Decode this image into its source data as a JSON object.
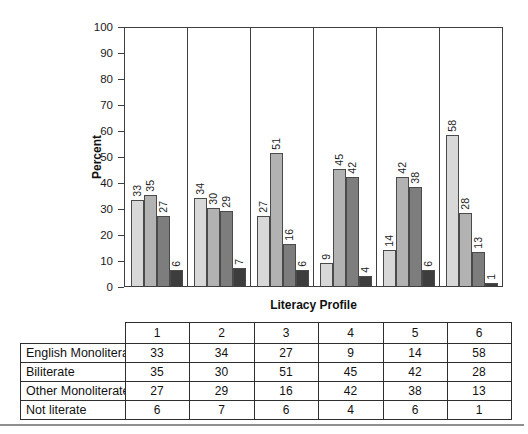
{
  "chart_data": {
    "type": "bar",
    "title": "",
    "xlabel": "Literacy Profile",
    "ylabel": "Percent",
    "ylim": [
      0,
      100
    ],
    "yticks": [
      0,
      10,
      20,
      30,
      40,
      50,
      60,
      70,
      80,
      90,
      100
    ],
    "grid": false,
    "legend_position": "none (data table below chart serves as legend)",
    "bar_value_labels": "rotated 90deg above each bar",
    "categories": [
      "1",
      "2",
      "3",
      "4",
      "5",
      "6"
    ],
    "series": [
      {
        "name": "English Monoliterate",
        "color": "#d8d8d8",
        "values": [
          33,
          34,
          27,
          9,
          14,
          58
        ]
      },
      {
        "name": "Biliterate",
        "color": "#b2b2b2",
        "values": [
          35,
          30,
          51,
          45,
          42,
          28
        ]
      },
      {
        "name": "Other Monoliterate",
        "color": "#7d7d7d",
        "values": [
          27,
          29,
          16,
          42,
          38,
          13
        ]
      },
      {
        "name": "Not literate",
        "color": "#3d3d3d",
        "values": [
          6,
          7,
          6,
          4,
          6,
          1
        ]
      }
    ]
  },
  "table": {
    "column_headers": [
      "1",
      "2",
      "3",
      "4",
      "5",
      "6"
    ],
    "rows": [
      {
        "label": "English Monoliterate",
        "values": [
          "33",
          "34",
          "27",
          "9",
          "14",
          "58"
        ]
      },
      {
        "label": "Biliterate",
        "values": [
          "35",
          "30",
          "51",
          "45",
          "42",
          "28"
        ]
      },
      {
        "label": "Other Monoliterate",
        "values": [
          "27",
          "29",
          "16",
          "42",
          "38",
          "13"
        ]
      },
      {
        "label": "Not literate",
        "values": [
          "6",
          "7",
          "6",
          "4",
          "6",
          "1"
        ]
      }
    ]
  },
  "decor": {
    "bottom_rule_color": "#8f8f8f"
  }
}
